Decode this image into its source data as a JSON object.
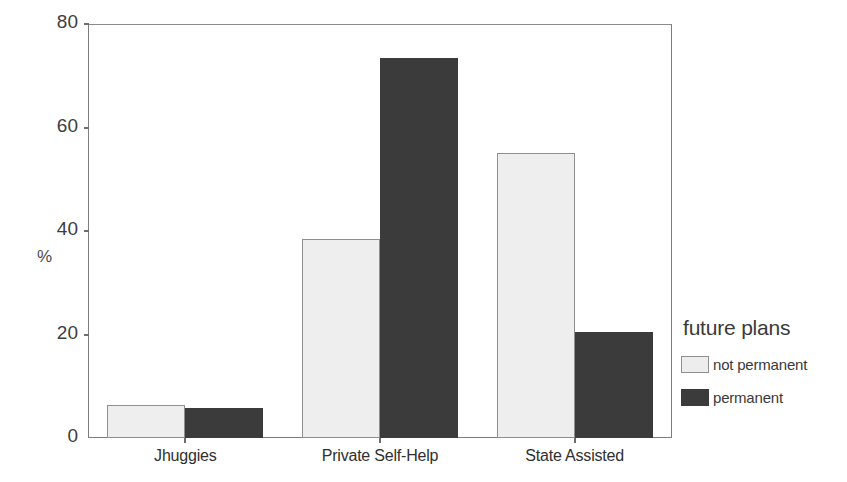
{
  "chart_data": {
    "type": "bar",
    "title": "",
    "subtitle": "",
    "xlabel": "",
    "ylabel": "%",
    "categories": [
      "Jhuggies",
      "Private Self-Help",
      "State Assisted"
    ],
    "series": [
      {
        "name": "not permanent",
        "color": "#eeeeee",
        "values": [
          6.4,
          38.5,
          55.0
        ]
      },
      {
        "name": "permanent",
        "color": "#3b3b3b",
        "values": [
          5.8,
          73.5,
          20.5
        ]
      }
    ],
    "ylim": [
      0,
      80
    ],
    "yticks": [
      0,
      20,
      40,
      60,
      80
    ],
    "ytick_labels": [
      "0",
      "20",
      "40",
      "60",
      "80"
    ],
    "grid": false,
    "legend": {
      "title": "future plans",
      "position": "right",
      "entries": [
        "not permanent",
        "permanent"
      ]
    }
  },
  "axes": {
    "y_label": "%",
    "y_ticks": [
      "80",
      "60",
      "40",
      "20",
      "0"
    ],
    "x_ticks": [
      "Jhuggies",
      "Private Self-Help",
      "State Assisted"
    ]
  },
  "legend": {
    "title": "future plans",
    "items": [
      {
        "label": "not permanent",
        "swatch": "light-swatch-icon"
      },
      {
        "label": "permanent",
        "swatch": "dark-swatch-icon"
      }
    ]
  },
  "colors": {
    "series_light": "#eeeeee",
    "series_dark": "#3b3b3b",
    "axis": "#7d7d7d",
    "text": "#3a3a3a",
    "background": "#ffffff"
  }
}
